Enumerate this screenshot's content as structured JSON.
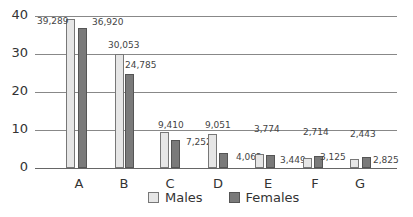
{
  "chart_data": {
    "type": "bar",
    "title": "",
    "xlabel": "",
    "ylabel": "",
    "ylim": [
      0,
      40
    ],
    "yticks": [
      0,
      10,
      20,
      30,
      40
    ],
    "grid": true,
    "legend_position": "bottom",
    "categories": [
      "A",
      "B",
      "C",
      "D",
      "E",
      "F",
      "G"
    ],
    "series": [
      {
        "name": "Males",
        "color": "#e6e6e6",
        "values": [
          39289,
          30053,
          9410,
          9051,
          3774,
          2714,
          2443
        ],
        "labels": [
          "39,289",
          "30,053",
          "9,410",
          "9,051",
          "3,774",
          "2,714",
          "2,443"
        ]
      },
      {
        "name": "Females",
        "color": "#7a7a7a",
        "values": [
          36920,
          24785,
          7252,
          4062,
          3449,
          3125,
          2825
        ],
        "labels": [
          "36,920",
          "24,785",
          "7,252",
          "4,062",
          "3,449",
          "3,125",
          "2,825"
        ]
      }
    ],
    "value_unit_note": "y-axis in thousands"
  },
  "legend": {
    "males": "Males",
    "females": "Females"
  }
}
